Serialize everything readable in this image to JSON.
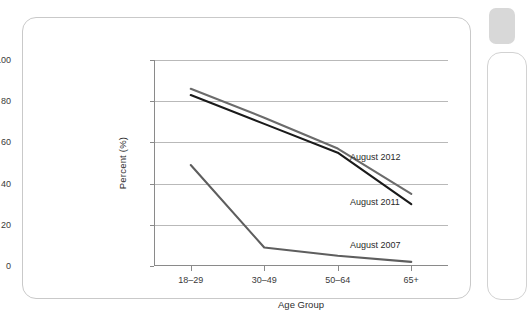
{
  "chart_data": {
    "type": "line",
    "title": "",
    "xlabel": "Age Group",
    "ylabel": "Percent (%)",
    "categories": [
      "18–29",
      "30–49",
      "50–64",
      "65+"
    ],
    "ylim": [
      0,
      100
    ],
    "yticks": [
      0,
      20,
      40,
      60,
      80,
      100
    ],
    "grid": true,
    "legend_position": "inline-annotations",
    "series": [
      {
        "name": "August 2012",
        "color": "#6b6b6b",
        "values": [
          86,
          72,
          57,
          35
        ]
      },
      {
        "name": "August 2011",
        "color": "#1a1a1a",
        "values": [
          83,
          69,
          55,
          30
        ]
      },
      {
        "name": "August 2007",
        "color": "#5e5e5e",
        "values": [
          49,
          9,
          5,
          2
        ]
      }
    ],
    "annotations": [
      {
        "text": "August 2012",
        "series": "August 2012"
      },
      {
        "text": "August 2011",
        "series": "August 2011"
      },
      {
        "text": "August 2007",
        "series": "August 2007"
      }
    ]
  },
  "yticks": {
    "t0": "0",
    "t20": "20",
    "t40": "40",
    "t60": "60",
    "t80": "80",
    "t100": "100"
  },
  "xticks": {
    "c0": "18–29",
    "c1": "30–49",
    "c2": "50–64",
    "c3": "65+"
  },
  "axes": {
    "ylabel": "Percent (%)",
    "xlabel": "Age Group"
  },
  "notes": {
    "n2012": "August 2012",
    "n2011": "August 2011",
    "n2007": "August 2007"
  }
}
